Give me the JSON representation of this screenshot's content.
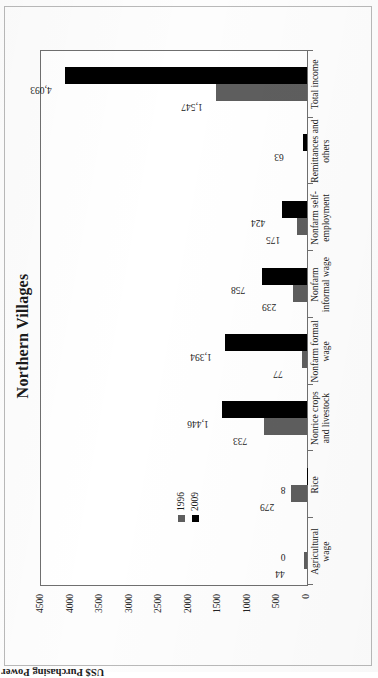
{
  "chart_data": {
    "type": "bar",
    "orientation": "vertical",
    "title": "Northern Villages",
    "xlabel": "",
    "ylabel": "US$ Purchasing Power Parity in 2005",
    "ylim": [
      0,
      4500
    ],
    "yticks": [
      4500,
      4000,
      3500,
      3000,
      2500,
      2000,
      1500,
      1000,
      500,
      0
    ],
    "ytick_labels": [
      "4500",
      "4000",
      "3500",
      "3000",
      "2500",
      "2000",
      "1500",
      "1000",
      "500",
      "0"
    ],
    "grid": false,
    "legend_position": "upper-left-inside",
    "categories": [
      "Agricultural wage",
      "Rice",
      "Nonrice crops and livestock",
      "Nonfarm formal wage",
      "Nonfarm informal wage",
      "Nonfarm self-employment",
      "Remittances and others",
      "Total income"
    ],
    "category_lines": [
      [
        "Agricultural",
        "wage"
      ],
      [
        "Rice"
      ],
      [
        "Nonrice crops",
        "and livestock"
      ],
      [
        "Nonfarm formal",
        "wage"
      ],
      [
        "Nonfarm",
        "informal wage"
      ],
      [
        "Nonfarm self-",
        "employment"
      ],
      [
        "Remittances and",
        "others"
      ],
      [
        "Total income"
      ]
    ],
    "series": [
      {
        "name": "1996",
        "color": "#5e5e5e",
        "values": [
          44,
          279,
          733,
          77,
          239,
          175,
          null,
          1547
        ],
        "labels": [
          "44",
          "279",
          "733",
          "77",
          "239",
          "175",
          "",
          "1,547"
        ]
      },
      {
        "name": "2009",
        "color": "#000000",
        "values": [
          0,
          8,
          1446,
          1394,
          758,
          424,
          63,
          4093
        ],
        "labels": [
          "0",
          "8",
          "1,446",
          "1,394",
          "758",
          "424",
          "63",
          "4,093"
        ]
      }
    ]
  },
  "legend": {
    "items": [
      {
        "label": "1996",
        "color": "#5e5e5e"
      },
      {
        "label": "2009",
        "color": "#000000"
      }
    ]
  }
}
